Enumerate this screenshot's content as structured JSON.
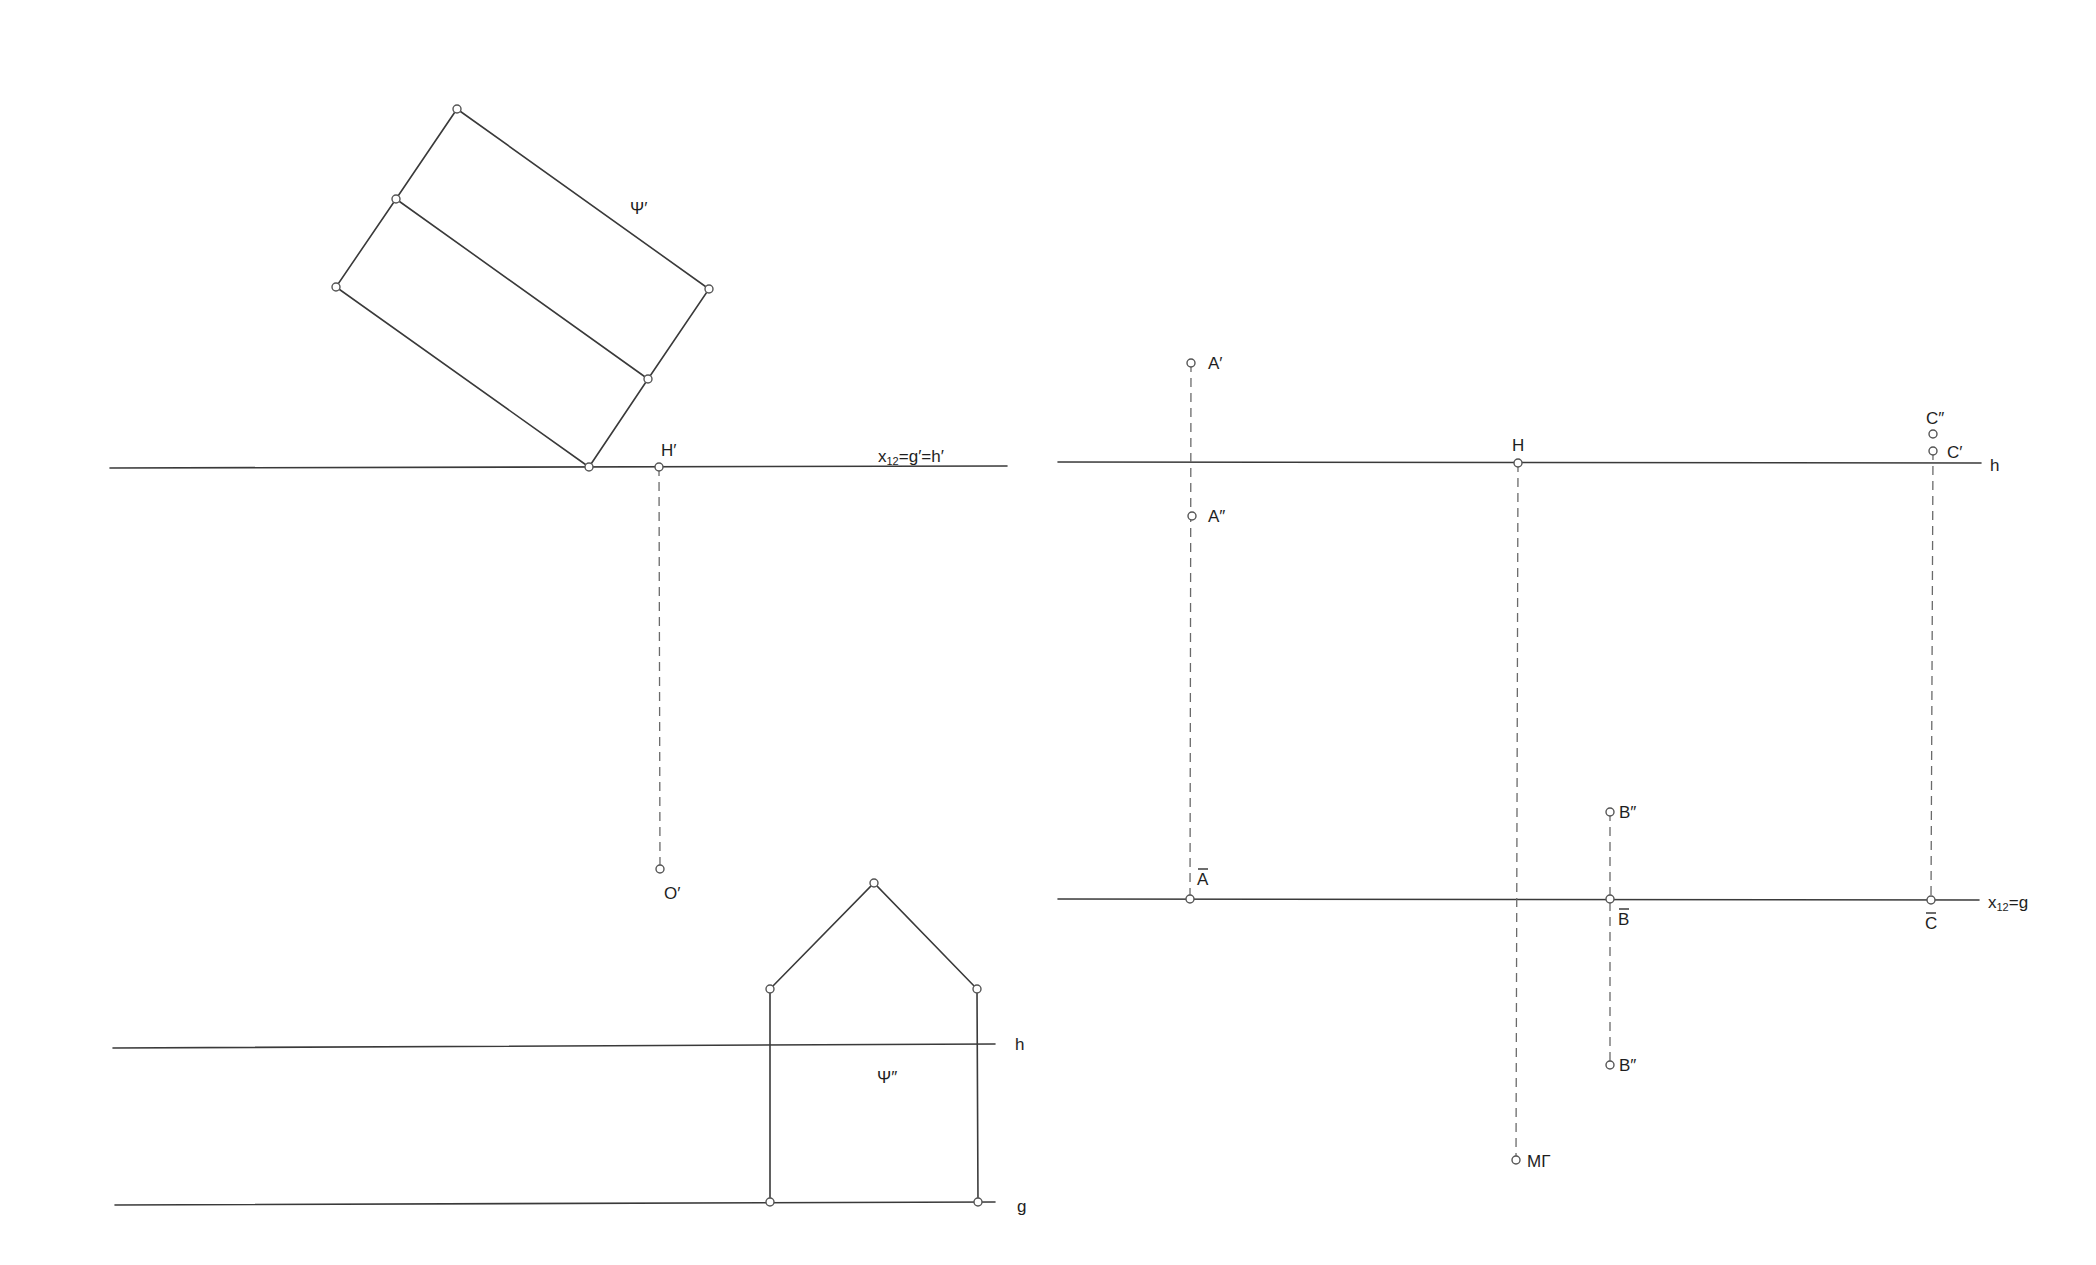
{
  "diagram": {
    "background": "#ffffff",
    "line_color": "#3a3a3a",
    "left_top_view": {
      "axis_line": {
        "x1": 110,
        "y1": 468,
        "x2": 1007,
        "y2": 466
      },
      "axis_label": {
        "main": "x",
        "sub": "12",
        "rest": "=g′=h′",
        "x": 878,
        "y": 462
      },
      "rectangle_psi_prime": {
        "points": [
          {
            "name": "top",
            "x": 457,
            "y": 109
          },
          {
            "name": "mid-left",
            "x": 396,
            "y": 199
          },
          {
            "name": "left",
            "x": 336,
            "y": 287
          },
          {
            "name": "right",
            "x": 709,
            "y": 289
          },
          {
            "name": "mid-right",
            "x": 648,
            "y": 379
          },
          {
            "name": "bottom",
            "x": 589,
            "y": 467
          }
        ],
        "label": {
          "text": "Ψ′",
          "x": 630,
          "y": 214
        }
      },
      "point_H_prime": {
        "x": 659,
        "y": 467,
        "label": "H′",
        "lx": 661,
        "ly": 456
      },
      "point_O_prime": {
        "x": 660,
        "y": 869,
        "label": "O′",
        "lx": 664,
        "ly": 899
      },
      "projector_H_O": {
        "x1": 659,
        "y1": 467,
        "x2": 660,
        "y2": 869
      }
    },
    "left_front_view": {
      "h_line": {
        "x1": 113,
        "y1": 1048,
        "x2": 995,
        "y2": 1044,
        "label": "h",
        "lx": 1015,
        "ly": 1050
      },
      "g_line": {
        "x1": 115,
        "y1": 1205,
        "x2": 995,
        "y2": 1202,
        "label": "g",
        "lx": 1017,
        "ly": 1212
      },
      "house_psi_double": {
        "apex": {
          "x": 874,
          "y": 883
        },
        "left_eave": {
          "x": 770,
          "y": 989
        },
        "right_eave": {
          "x": 977,
          "y": 989
        },
        "bottom_left": {
          "x": 770,
          "y": 1202
        },
        "bottom_right": {
          "x": 978,
          "y": 1202
        },
        "label": {
          "text": "Ψ″",
          "x": 877,
          "y": 1083
        }
      }
    },
    "right_view": {
      "h_line": {
        "x1": 1058,
        "y1": 462,
        "x2": 1981,
        "y2": 463,
        "label": "h",
        "lx": 1990,
        "ly": 471
      },
      "g_line": {
        "x1": 1058,
        "y1": 899,
        "x2": 1979,
        "y2": 900
      },
      "g_label": {
        "main": "x",
        "sub": "12",
        "rest": "=g",
        "x": 1988,
        "y": 908
      },
      "points": [
        {
          "id": "A_prime",
          "x": 1191,
          "y": 363,
          "label": "A′",
          "lx": 1208,
          "ly": 369
        },
        {
          "id": "A_double",
          "x": 1192,
          "y": 516,
          "label": "A″",
          "lx": 1208,
          "ly": 522
        },
        {
          "id": "A_bar",
          "x": 1190,
          "y": 899,
          "label": "A",
          "bar": true,
          "lx": 1197,
          "ly": 885
        },
        {
          "id": "H",
          "x": 1518,
          "y": 463,
          "label": "H",
          "lx": 1512,
          "ly": 451
        },
        {
          "id": "M_gamma",
          "x": 1516,
          "y": 1160,
          "label": "MΓ",
          "lx": 1527,
          "ly": 1167
        },
        {
          "id": "B_double_upper",
          "x": 1610,
          "y": 812,
          "label": "B″",
          "lx": 1619,
          "ly": 818
        },
        {
          "id": "B_bar",
          "x": 1610,
          "y": 899,
          "label": "B",
          "bar": true,
          "lx": 1618,
          "ly": 925
        },
        {
          "id": "B_double_lower",
          "x": 1610,
          "y": 1065,
          "label": "B″",
          "lx": 1619,
          "ly": 1071
        },
        {
          "id": "C_double",
          "x": 1933,
          "y": 434,
          "label": "C″",
          "lx": 1926,
          "ly": 424
        },
        {
          "id": "C_prime",
          "x": 1933,
          "y": 451,
          "label": "C′",
          "lx": 1947,
          "ly": 458
        },
        {
          "id": "C_bar",
          "x": 1931,
          "y": 900,
          "label": "C",
          "bar": true,
          "lx": 1925,
          "ly": 929
        }
      ],
      "projectors": [
        {
          "name": "A",
          "x1": 1191,
          "y1": 363,
          "x2": 1190,
          "y2": 899
        },
        {
          "name": "H",
          "x1": 1518,
          "y1": 463,
          "x2": 1516,
          "y2": 1160
        },
        {
          "name": "B",
          "x1": 1610,
          "y1": 812,
          "x2": 1610,
          "y2": 1065
        },
        {
          "name": "C",
          "x1": 1933,
          "y1": 451,
          "x2": 1931,
          "y2": 900
        }
      ]
    }
  }
}
